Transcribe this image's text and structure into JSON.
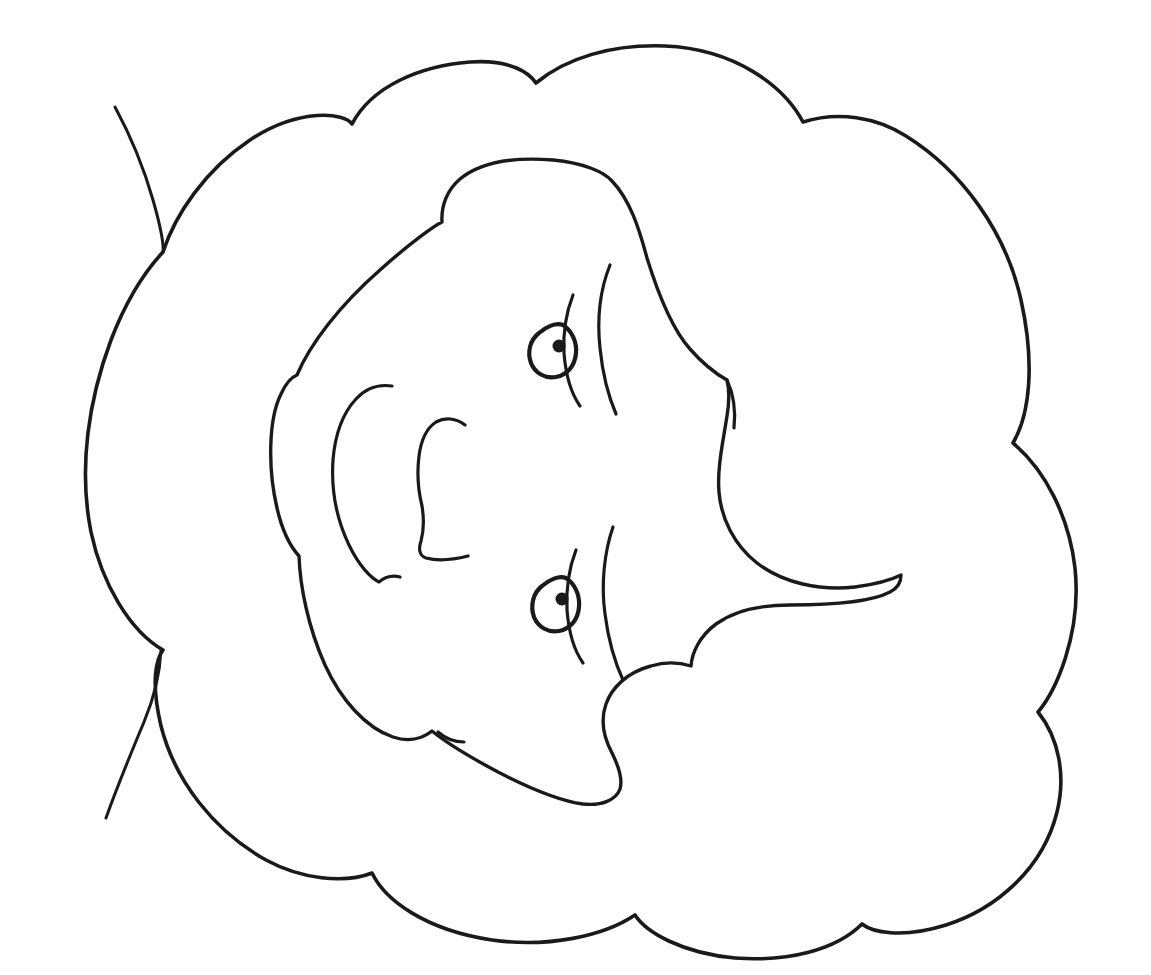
{
  "artwork": {
    "title": "Line drawing of a face with curly hair",
    "style": "coloring-book line art",
    "background_color": "#ffffff",
    "ink_color": "#1a1a1a",
    "canvas": {
      "width": 1151,
      "height": 975
    },
    "orientation_note": "face rotated roughly 90 degrees, looking toward the left edge",
    "elements": [
      {
        "name": "hair-outline",
        "label": "Curly hair outer silhouette",
        "kind": "closed-scalloped-contour"
      },
      {
        "name": "face-outline",
        "label": "Face and jaw contour",
        "kind": "closed-contour"
      },
      {
        "name": "upper-eye",
        "label": "Upper eye with pupil",
        "kind": "eye"
      },
      {
        "name": "lower-eye",
        "label": "Lower eye with pupil",
        "kind": "eye"
      },
      {
        "name": "upper-eyebrow",
        "label": "Upper eyebrow arc",
        "kind": "stroke"
      },
      {
        "name": "lower-eyebrow",
        "label": "Lower eyebrow arc",
        "kind": "stroke"
      },
      {
        "name": "nose",
        "label": "Nose profile",
        "kind": "stroke"
      },
      {
        "name": "mouth",
        "label": "Mouth line",
        "kind": "stroke"
      },
      {
        "name": "chin-crease",
        "label": "Chin / cheek crease",
        "kind": "stroke"
      },
      {
        "name": "hair-wisp-upper",
        "label": "Upper stray hair strand",
        "kind": "stroke"
      },
      {
        "name": "hair-wisp-lower",
        "label": "Lower stray hair strand",
        "kind": "stroke"
      }
    ]
  },
  "paths": {
    "hair_outline": "M 163 252 C 175 215 205 170 250 140 C 300 107 345 113 352 124 C 372 86 420 66 470 62 C 512 59 530 74 536 83 C 566 58 612 44 665 46 C 735 49 784 86 803 122 C 838 111 876 117 906 136 C 962 171 1006 232 1021 300 C 1035 363 1030 414 1013 443 C 1045 470 1069 516 1075 568 C 1082 635 1055 692 1038 712 C 1059 738 1066 776 1057 812 C 1043 869 996 909 946 925 C 901 939 872 932 862 924 C 836 950 788 962 735 958 C 681 953 646 932 635 915 C 604 936 548 948 492 940 C 425 930 385 900 372 873 C 344 884 301 879 266 860 C 214 831 175 781 161 726 C 150 679 157 658 163 650 C 130 631 102 584 91 532 C 78 467 89 399 111 340 C 129 293 150 266 163 252 Z",
    "face_outline": "M 297 375 C 310 344 340 305 380 270 C 410 243 434 226 442 222 C 441 206 447 190 460 179 C 482 161 516 157 553 160 C 584 163 604 172 612 181 C 630 200 639 228 647 258 C 660 300 673 330 690 349 C 704 365 718 375 727 380 C 730 392 729 404 727 416 C 723 442 717 468 719 492 C 721 518 734 545 757 563 C 783 583 820 591 855 587 C 878 584 893 579 901 575 C 901 581 898 588 890 592 C 871 602 829 605 790 605 C 758 605 734 611 716 624 C 700 636 692 652 691 666 C 678 662 664 662 651 666 C 628 672 612 687 606 704 C 600 721 604 738 612 753 C 619 767 623 779 620 789 C 616 800 602 806 583 804 C 561 801 531 789 498 772 C 466 755 443 740 432 731 C 422 739 408 742 393 737 C 366 728 341 700 325 665 C 308 627 300 586 299 556 C 290 546 282 530 277 508 C 268 470 268 420 281 394 C 286 383 292 377 297 375 Z",
    "upper_eyebrow": "M 610 265 C 600 290 597 320 600 348 C 603 378 610 400 616 414",
    "upper_eye_lid": "M 573 295 C 566 313 563 334 564 353 C 566 379 573 396 580 406",
    "upper_eye_ring": "M 563 325 C 572 331 577 342 576 353 C 575 366 567 375 556 377 C 545 379 535 373 531 363 C 527 352 530 340 539 333 C 546 327 556 322 563 325 Z",
    "upper_pupil": {
      "cx": 559,
      "cy": 346,
      "r": 6.5
    },
    "lower_eyebrow": "M 613 527 C 604 553 601 585 605 614 C 609 645 617 667 623 680",
    "lower_eye_lid": "M 576 550 C 569 568 566 590 567 610 C 569 636 576 653 583 663",
    "lower_eye_ring": "M 566 578 C 575 584 580 595 579 607 C 578 620 570 629 559 631 C 548 633 538 627 534 617 C 530 606 533 593 542 586 C 549 580 559 575 566 578 Z",
    "lower_pupil": {
      "cx": 562,
      "cy": 599,
      "r": 6.5
    },
    "nose": "M 392 386 C 378 384 365 389 356 399 C 343 413 335 435 333 460 C 331 490 337 520 349 545 C 359 566 371 578 379 582 C 385 577 392 575 400 577",
    "mouth": "M 465 425 C 456 418 445 417 436 422 C 427 428 421 440 419 456 C 417 472 418 490 422 506 C 424 518 424 530 421 541 C 418 550 420 556 426 558 C 437 561 452 560 468 556",
    "chin_crease": "M 438 732 C 446 739 455 742 464 742",
    "hair_wisp_upper": "M 115 107 C 128 131 143 165 153 200 C 161 228 164 243 163 252",
    "hair_wisp_lower": "M 106 818 C 116 790 131 753 144 722 C 154 698 160 672 161 650",
    "cheek_line": "M 727 380 C 733 393 736 410 734 428"
  }
}
